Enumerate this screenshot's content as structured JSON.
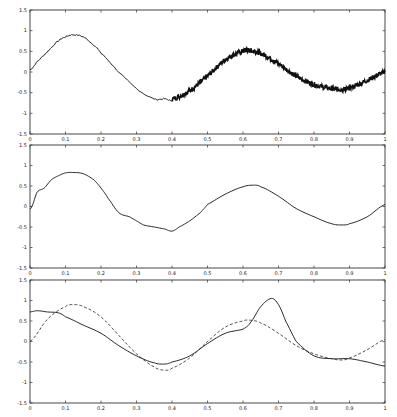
{
  "chart_data": [
    {
      "type": "line",
      "title": "",
      "xlabel": "",
      "ylabel": "",
      "xlim": [
        0,
        1
      ],
      "ylim": [
        -1.5,
        1.5
      ],
      "grid": false,
      "xticks": [
        "0",
        "0.1",
        "0.2",
        "0.3",
        "0.4",
        "0.5",
        "0.6",
        "0.7",
        "0.8",
        "0.9",
        "1"
      ],
      "yticks": [
        "-1.5",
        "-1",
        "-0.5",
        "0",
        "0.5",
        "1",
        "1.5"
      ],
      "series": [
        {
          "name": "signal (low noise segment)",
          "style": "solid",
          "x": [
            0,
            0.02,
            0.05,
            0.08,
            0.1,
            0.12,
            0.15,
            0.18,
            0.2,
            0.25,
            0.3,
            0.35,
            0.38,
            0.4
          ],
          "y": [
            0.05,
            0.25,
            0.5,
            0.75,
            0.85,
            0.9,
            0.85,
            0.65,
            0.45,
            0.0,
            -0.4,
            -0.65,
            -0.65,
            -0.7
          ]
        },
        {
          "name": "signal (high noise segment)",
          "style": "noisy",
          "x": [
            0.4,
            0.45,
            0.5,
            0.55,
            0.6,
            0.62,
            0.65,
            0.7,
            0.75,
            0.8,
            0.85,
            0.88,
            0.9,
            0.95,
            1.0
          ],
          "y": [
            -0.65,
            -0.45,
            -0.1,
            0.3,
            0.5,
            0.52,
            0.45,
            0.2,
            -0.1,
            -0.3,
            -0.4,
            -0.42,
            -0.38,
            -0.2,
            0.0
          ]
        }
      ]
    },
    {
      "type": "line",
      "title": "",
      "xlabel": "",
      "ylabel": "",
      "xlim": [
        0,
        1
      ],
      "ylim": [
        -1.5,
        1.5
      ],
      "grid": false,
      "xticks": [
        "0",
        "0.1",
        "0.2",
        "0.3",
        "0.4",
        "0.5",
        "0.6",
        "0.7",
        "0.8",
        "0.9",
        "1"
      ],
      "yticks": [
        "-1.5",
        "-1",
        "-0.5",
        "0",
        "0.5",
        "1",
        "1.5"
      ],
      "series": [
        {
          "name": "denoised estimate",
          "style": "solid",
          "x": [
            0,
            0.005,
            0.02,
            0.04,
            0.06,
            0.08,
            0.1,
            0.12,
            0.15,
            0.18,
            0.2,
            0.22,
            0.25,
            0.28,
            0.3,
            0.32,
            0.35,
            0.38,
            0.4,
            0.42,
            0.45,
            0.48,
            0.5,
            0.55,
            0.6,
            0.63,
            0.65,
            0.7,
            0.75,
            0.8,
            0.85,
            0.88,
            0.9,
            0.95,
            1.0
          ],
          "y": [
            -0.05,
            0.0,
            0.35,
            0.45,
            0.65,
            0.75,
            0.82,
            0.83,
            0.8,
            0.65,
            0.45,
            0.2,
            -0.15,
            -0.25,
            -0.35,
            -0.45,
            -0.5,
            -0.55,
            -0.6,
            -0.5,
            -0.35,
            -0.15,
            0.05,
            0.3,
            0.48,
            0.52,
            0.48,
            0.25,
            -0.05,
            -0.25,
            -0.42,
            -0.45,
            -0.42,
            -0.25,
            0.05
          ]
        }
      ]
    },
    {
      "type": "line",
      "title": "",
      "xlabel": "",
      "ylabel": "",
      "xlim": [
        0,
        1
      ],
      "ylim": [
        -1.5,
        1.5
      ],
      "grid": false,
      "xticks": [
        "0",
        "0.1",
        "0.2",
        "0.3",
        "0.4",
        "0.5",
        "0.6",
        "0.7",
        "0.8",
        "0.9",
        "1"
      ],
      "yticks": [
        "-1.5",
        "-1",
        "-0.5",
        "0",
        "0.5",
        "1",
        "1.5"
      ],
      "series": [
        {
          "name": "estimate",
          "style": "solid",
          "x": [
            0,
            0.02,
            0.05,
            0.08,
            0.1,
            0.15,
            0.2,
            0.25,
            0.3,
            0.35,
            0.38,
            0.4,
            0.45,
            0.5,
            0.55,
            0.6,
            0.62,
            0.65,
            0.68,
            0.7,
            0.72,
            0.75,
            0.8,
            0.85,
            0.9,
            0.95,
            1.0
          ],
          "y": [
            0.72,
            0.75,
            0.72,
            0.7,
            0.6,
            0.4,
            0.2,
            -0.1,
            -0.35,
            -0.52,
            -0.55,
            -0.5,
            -0.35,
            -0.05,
            0.2,
            0.3,
            0.45,
            0.85,
            1.05,
            0.9,
            0.5,
            0.0,
            -0.35,
            -0.42,
            -0.42,
            -0.5,
            -0.6
          ]
        },
        {
          "name": "true signal",
          "style": "dashed",
          "x": [
            0,
            0.05,
            0.1,
            0.12,
            0.15,
            0.2,
            0.25,
            0.3,
            0.35,
            0.38,
            0.4,
            0.45,
            0.5,
            0.55,
            0.6,
            0.62,
            0.65,
            0.7,
            0.75,
            0.8,
            0.85,
            0.88,
            0.9,
            0.95,
            1.0
          ],
          "y": [
            0.0,
            0.55,
            0.85,
            0.9,
            0.85,
            0.6,
            0.15,
            -0.3,
            -0.62,
            -0.7,
            -0.65,
            -0.4,
            0.0,
            0.35,
            0.5,
            0.52,
            0.45,
            0.2,
            -0.1,
            -0.3,
            -0.42,
            -0.45,
            -0.4,
            -0.2,
            0.05
          ]
        }
      ]
    }
  ],
  "panels": [
    {
      "id": "panel-1",
      "top": 10,
      "bottom": 134
    },
    {
      "id": "panel-2",
      "top": 145,
      "bottom": 268
    },
    {
      "id": "panel-3",
      "top": 280,
      "bottom": 403
    }
  ],
  "axes": {
    "left": 30,
    "right": 385
  },
  "colors": {
    "line": "#111111",
    "frame": "#333333",
    "background": "#ffffff"
  }
}
